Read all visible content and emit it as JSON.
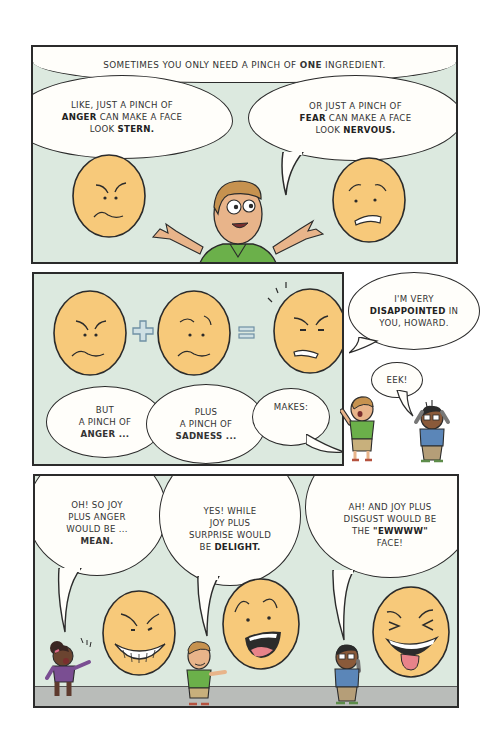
{
  "page": {
    "background": "#ffffff",
    "panel_background": "#dce9df",
    "face_color": "#f7c97a",
    "line_color": "#2b2b2b"
  },
  "panel1": {
    "caption": {
      "pre": "Sometimes you only need a pinch of ",
      "bold": "ONE",
      "post": " ingredient."
    },
    "bubble_left": {
      "line1": "Like, just a pinch of",
      "bold1": "ANGER",
      "line2": " can make a face",
      "line3": "look ",
      "bold2": "STERN."
    },
    "bubble_right": {
      "line1": "Or just a pinch of",
      "bold1": "FEAR",
      "line2": " can make a face",
      "line3": "look ",
      "bold2": "NERVOUS."
    },
    "faces": [
      {
        "emotion": "anger",
        "label": "stern-face"
      },
      {
        "emotion": "fear",
        "label": "nervous-face"
      }
    ],
    "character": "shrugging-man"
  },
  "panel2": {
    "operators": [
      "+",
      "="
    ],
    "faces": [
      {
        "emotion": "anger"
      },
      {
        "emotion": "sadness"
      },
      {
        "emotion": "disappointed"
      }
    ],
    "bubble_1": {
      "line1": "But",
      "line2": "a pinch of",
      "bold": "ANGER ..."
    },
    "bubble_2": {
      "line1": "Plus",
      "line2": "a pinch of",
      "bold": "SADNESS ..."
    },
    "bubble_3": {
      "text": "Makes:"
    }
  },
  "side": {
    "bubble_disappointed": {
      "line1": "I'm very",
      "bold": "DISAPPOINTED",
      "post": " in",
      "line3": "you, Howard."
    },
    "bubble_eek": {
      "text": "Eek!"
    }
  },
  "panel3": {
    "bubble_1": {
      "line1": "Oh! So joy",
      "line2": "plus anger",
      "line3": "would be ...",
      "bold": "MEAN."
    },
    "bubble_2": {
      "line1": "Yes! While",
      "line2": "joy plus",
      "line3": "surprise would",
      "pre": "be ",
      "bold": "DELIGHT."
    },
    "bubble_3": {
      "line1": "Ah! And joy plus",
      "line2": "disgust would be",
      "pre": "the ",
      "bold": "\"EWWWW\"",
      "line4": "face!"
    },
    "faces": [
      {
        "emotion": "mean"
      },
      {
        "emotion": "delight"
      },
      {
        "emotion": "ewww"
      }
    ]
  }
}
